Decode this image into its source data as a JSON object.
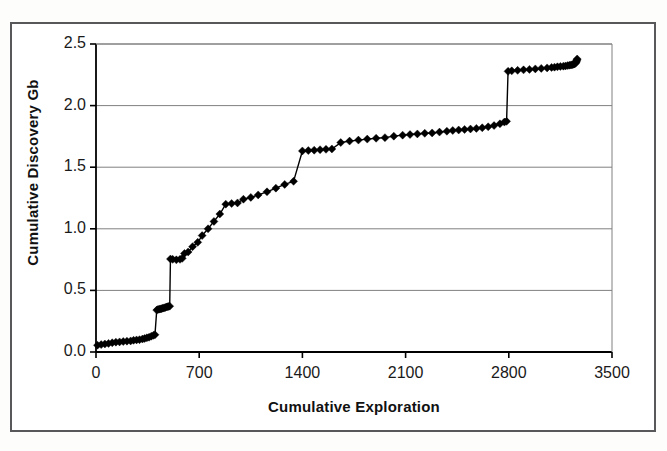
{
  "figure": {
    "background_color": "#ffffff",
    "frame_color": "#58585a",
    "axis_color": "#000000",
    "grid_color": "#808080",
    "series_color": "#000000"
  },
  "axis_titles": {
    "y": "Cumulative Discovery Gb",
    "x": "Cumulative Exploration"
  },
  "chart_data": {
    "type": "line",
    "title": "",
    "subtitle": "",
    "xlabel": "Cumulative Exploration",
    "ylabel": "Cumulative Discovery Gb",
    "xlim": [
      0,
      3500
    ],
    "ylim": [
      0.0,
      2.5
    ],
    "xticks": [
      0,
      700,
      1400,
      2100,
      2800,
      3500
    ],
    "xtick_labels": [
      "0",
      "700",
      "1400",
      "2100",
      "2800",
      "3500"
    ],
    "yticks": [
      0.0,
      0.5,
      1.0,
      1.5,
      2.0,
      2.5
    ],
    "ytick_labels": [
      "0.0",
      "0.5",
      "1.0",
      "1.5",
      "2.0",
      "2.5"
    ],
    "grid": "horizontal",
    "legend": "none",
    "marker": "diamond",
    "marker_size": 4,
    "line_width": 1.4,
    "series": [
      {
        "name": "Cumulative Discovery",
        "x": [
          10,
          35,
          60,
          85,
          110,
          135,
          160,
          185,
          210,
          235,
          255,
          275,
          295,
          315,
          330,
          345,
          360,
          375,
          390,
          400,
          412,
          420,
          428,
          436,
          444,
          452,
          460,
          468,
          476,
          484,
          492,
          500,
          505,
          520,
          545,
          570,
          585,
          600,
          625,
          655,
          690,
          720,
          760,
          800,
          840,
          880,
          920,
          960,
          1000,
          1050,
          1100,
          1160,
          1220,
          1280,
          1340,
          1400,
          1440,
          1480,
          1520,
          1560,
          1600,
          1660,
          1720,
          1780,
          1840,
          1900,
          1960,
          2020,
          2080,
          2130,
          2180,
          2230,
          2280,
          2330,
          2380,
          2420,
          2460,
          2500,
          2540,
          2580,
          2620,
          2660,
          2700,
          2740,
          2770,
          2785,
          2795,
          2820,
          2860,
          2900,
          2940,
          2980,
          3020,
          3060,
          3090,
          3110,
          3130,
          3150,
          3170,
          3185,
          3200,
          3212,
          3222,
          3230,
          3238,
          3244,
          3250,
          3255,
          3258,
          3260,
          3262,
          3264
        ],
        "y": [
          0.055,
          0.06,
          0.065,
          0.07,
          0.075,
          0.08,
          0.082,
          0.085,
          0.088,
          0.09,
          0.095,
          0.098,
          0.1,
          0.105,
          0.11,
          0.115,
          0.12,
          0.128,
          0.135,
          0.14,
          0.34,
          0.345,
          0.348,
          0.35,
          0.352,
          0.355,
          0.358,
          0.36,
          0.365,
          0.368,
          0.37,
          0.372,
          0.755,
          0.752,
          0.748,
          0.752,
          0.76,
          0.8,
          0.812,
          0.855,
          0.89,
          0.945,
          1.0,
          1.06,
          1.12,
          1.2,
          1.205,
          1.21,
          1.24,
          1.255,
          1.275,
          1.3,
          1.33,
          1.36,
          1.385,
          1.632,
          1.635,
          1.638,
          1.642,
          1.645,
          1.648,
          1.7,
          1.712,
          1.72,
          1.728,
          1.735,
          1.74,
          1.752,
          1.76,
          1.765,
          1.77,
          1.775,
          1.778,
          1.785,
          1.792,
          1.798,
          1.802,
          1.806,
          1.81,
          1.815,
          1.82,
          1.828,
          1.838,
          1.852,
          1.866,
          1.872,
          2.278,
          2.282,
          2.286,
          2.29,
          2.294,
          2.298,
          2.302,
          2.306,
          2.31,
          2.312,
          2.315,
          2.318,
          2.32,
          2.322,
          2.325,
          2.328,
          2.33,
          2.332,
          2.335,
          2.338,
          2.342,
          2.348,
          2.356,
          2.364,
          2.372,
          2.378
        ]
      }
    ]
  }
}
